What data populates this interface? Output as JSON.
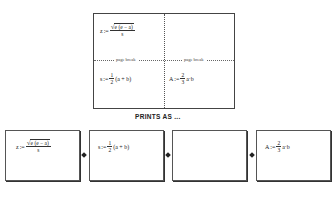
{
  "top_worksheet": {
    "region_topleft": {
      "lhs": "z",
      "assign": ":=",
      "numerator": "e (e − a)",
      "denominator": "s"
    },
    "break_left_label": "page break",
    "break_right_label": "page break",
    "region_bottomleft": {
      "lhs": "s",
      "assign": ":=",
      "numerator": "1",
      "denominator": "2",
      "rest": "(a + b)"
    },
    "region_bottomright": {
      "lhs": "A",
      "assign": ":=",
      "numerator": "2",
      "denominator": "3",
      "rest": "a·b"
    }
  },
  "caption": "PRINTS AS ...",
  "printed_pages": [
    {
      "lhs": "z",
      "assign": ":=",
      "numerator": "e (e − a)",
      "denominator": "s"
    },
    {
      "lhs": "s",
      "assign": ":=",
      "numerator": "1",
      "denominator": "2",
      "rest": "(a + b)"
    },
    {
      "empty": true
    },
    {
      "lhs": "A",
      "assign": ":=",
      "numerator": "2",
      "denominator": "3",
      "rest": "a·b"
    }
  ]
}
